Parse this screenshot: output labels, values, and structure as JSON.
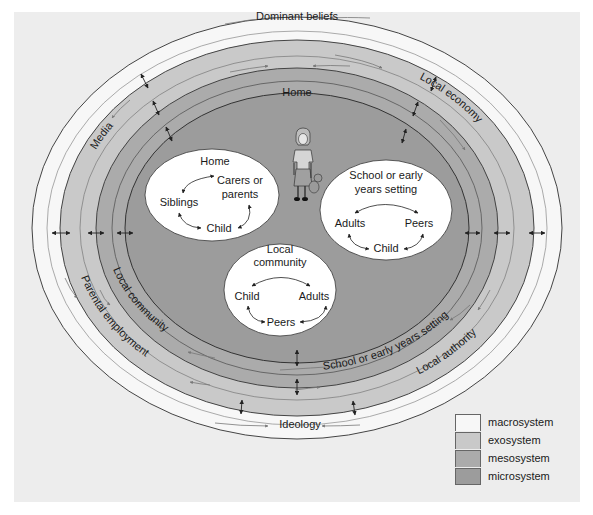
{
  "diagram": {
    "type": "ecological-systems-model",
    "colors": {
      "panel_background": "#ededed",
      "macrosystem": "#f7f7f7",
      "exosystem": "#c9c9c9",
      "mesosystem": "#ababab",
      "microsystem": "#9c9c9c",
      "bubble": "#ffffff",
      "text": "#1a1a1a"
    },
    "rings": {
      "macrosystem": {
        "labels": [
          "Dominant beliefs",
          "Ideology"
        ]
      },
      "exosystem": {
        "labels": [
          "Media",
          "Local economy",
          "Parental employment",
          "Local authority"
        ]
      },
      "mesosystem": {
        "labels": [
          "Home",
          "Local community",
          "School or early years setting"
        ]
      }
    },
    "bubbles": [
      {
        "title": "Home",
        "nodes": [
          "Carers or parents",
          "Siblings",
          "Child"
        ]
      },
      {
        "title": "School or early years setting",
        "nodes": [
          "Adults",
          "Peers",
          "Child"
        ]
      },
      {
        "title": "Local community",
        "nodes": [
          "Child",
          "Adults",
          "Peers"
        ]
      }
    ],
    "figure": "child-with-teddy-bear"
  },
  "labels": {
    "dominant_beliefs": "Dominant beliefs",
    "media": "Media",
    "local_economy": "Local economy",
    "home_ring": "Home",
    "local_community_ring": "Local community",
    "school_ring": "School or early years setting",
    "parental_employment": "Parental employment",
    "local_authority": "Local authority",
    "ideology": "Ideology"
  },
  "bubbles": {
    "home": {
      "title": "Home",
      "carers_1": "Carers or",
      "carers_2": "parents",
      "siblings": "Siblings",
      "child": "Child"
    },
    "school": {
      "title_1": "School or early",
      "title_2": "years setting",
      "adults": "Adults",
      "peers": "Peers",
      "child": "Child"
    },
    "community": {
      "title_1": "Local",
      "title_2": "community",
      "child": "Child",
      "adults": "Adults",
      "peers": "Peers"
    }
  },
  "legend": {
    "items": [
      {
        "label": "macrosystem",
        "color": "#f7f7f7"
      },
      {
        "label": "exosystem",
        "color": "#c9c9c9"
      },
      {
        "label": "mesosystem",
        "color": "#ababab"
      },
      {
        "label": "microsystem",
        "color": "#9c9c9c"
      }
    ]
  }
}
